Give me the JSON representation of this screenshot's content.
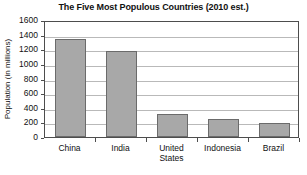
{
  "chart_data": {
    "type": "bar",
    "title": "The Five Most Populous Countries (2010 est.)",
    "xlabel": "",
    "ylabel": "Population (in millions)",
    "categories": [
      "China",
      "India",
      "United States",
      "Indonesia",
      "Brazil"
    ],
    "values": [
      1340,
      1170,
      310,
      240,
      195
    ],
    "ylim": [
      0,
      1600
    ],
    "ytick_values": [
      0,
      200,
      400,
      600,
      800,
      1000,
      1200,
      1400,
      1600
    ],
    "ytick_labels": [
      "0",
      "200",
      "400",
      "600",
      "800",
      "1000",
      "1200",
      "1400",
      "1600"
    ],
    "grid": true,
    "legend": false,
    "bar_color": "#a8a8a8",
    "bar_edge_color": "#6b6b6b",
    "grid_color": "#b9b9b9",
    "axis_color": "#4d4d4d",
    "background_color": "#ffffff"
  }
}
